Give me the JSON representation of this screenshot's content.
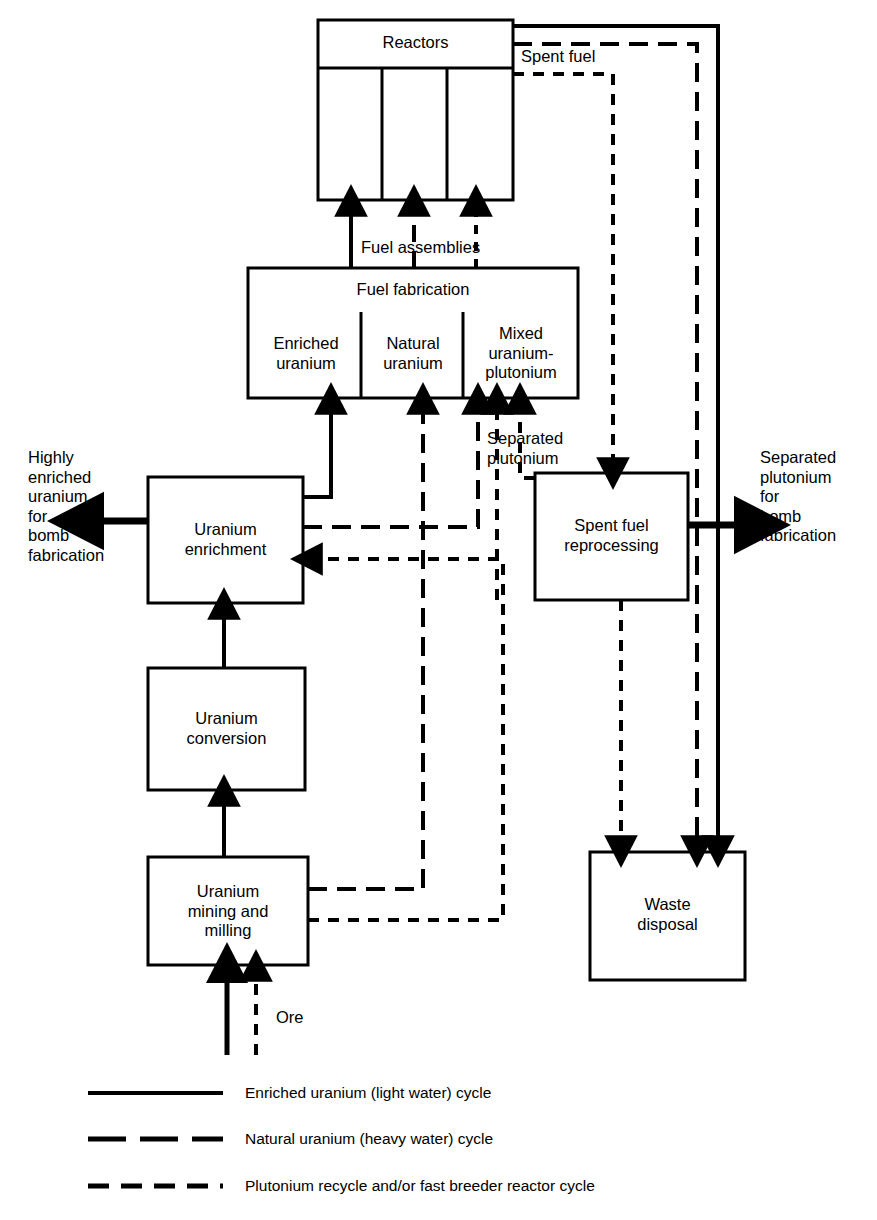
{
  "figure": {
    "type": "flow-diagram",
    "background": "#ffffff",
    "line_color": "#000000"
  },
  "boxes": {
    "reactors": {
      "label": "Reactors",
      "x": 318,
      "y": 20,
      "w": 195,
      "h": 180,
      "header_h": 48,
      "columns": 3
    },
    "fuel_fabrication": {
      "label": "Fuel fabrication",
      "x": 248,
      "y": 268,
      "w": 330,
      "h": 130,
      "header_h": 40,
      "cells": [
        "Enriched\nuranium",
        "Natural\nuranium",
        "Mixed\nuranium-\nplutonium"
      ]
    },
    "uranium_enrichment": {
      "label": "Uranium\nenrichment",
      "x": 148,
      "y": 477,
      "w": 155,
      "h": 126
    },
    "spent_fuel_reprocessing": {
      "label": "Spent fuel\nreprocessing",
      "x": 535,
      "y": 473,
      "w": 153,
      "h": 127
    },
    "uranium_conversion": {
      "label": "Uranium\nconversion",
      "x": 148,
      "y": 668,
      "w": 157,
      "h": 122
    },
    "uranium_mining": {
      "label": "Uranium\nmining and\nmilling",
      "x": 148,
      "y": 857,
      "w": 160,
      "h": 108
    },
    "waste_disposal": {
      "label": "Waste\ndisposal",
      "x": 590,
      "y": 852,
      "w": 155,
      "h": 128
    }
  },
  "flow_labels": {
    "spent_fuel": {
      "text": "Spent fuel",
      "x": 521,
      "y": 47
    },
    "fuel_assemblies": {
      "text": "Fuel assemblies",
      "x": 361,
      "y": 238
    },
    "separated_plutonium": {
      "text": "Separated\nplutonium",
      "x": 487,
      "y": 429
    },
    "highly_enriched_uranium_bomb": {
      "text": "Highly\nenriched\nuranium\nfor\nbomb\nfabrication",
      "x": 28,
      "y": 448
    },
    "separated_plutonium_bomb": {
      "text": "Separated\nplutonium\nfor\nbomb\nfabrication",
      "x": 760,
      "y": 448
    },
    "ore": {
      "text": "Ore",
      "x": 276,
      "y": 1018
    }
  },
  "legend": {
    "items": [
      {
        "style": "solid",
        "label": "Enriched uranium (light water) cycle"
      },
      {
        "style": "long-dash",
        "label": "Natural uranium (heavy water) cycle"
      },
      {
        "style": "short-dash",
        "label": "Plutonium recycle and/or fast breeder reactor cycle"
      }
    ],
    "sample_x": 88,
    "sample_w": 135,
    "text_x": 245,
    "rows_y": [
      1093,
      1139,
      1186
    ]
  },
  "flows": [
    {
      "from": "fuel_fabrication",
      "to": "reactors",
      "style": "solid",
      "label": "Fuel assemblies"
    },
    {
      "from": "fuel_fabrication",
      "to": "reactors",
      "style": "long-dash",
      "label": "Fuel assemblies"
    },
    {
      "from": "fuel_fabrication",
      "to": "reactors",
      "style": "short-dash",
      "label": "Fuel assemblies"
    },
    {
      "from": "reactors",
      "to": "waste_disposal",
      "style": "solid",
      "label": "Spent fuel"
    },
    {
      "from": "reactors",
      "to": "waste_disposal",
      "style": "long-dash",
      "label": "Spent fuel"
    },
    {
      "from": "reactors",
      "to": "spent_fuel_reprocessing",
      "style": "short-dash",
      "label": "Spent fuel"
    },
    {
      "from": "uranium_enrichment",
      "to": "fuel_fabrication",
      "style": "solid",
      "label": "Enriched uranium"
    },
    {
      "from": "uranium_enrichment",
      "to": "fuel_fabrication",
      "style": "long-dash",
      "label": ""
    },
    {
      "from": "uranium_mining",
      "to": "fuel_fabrication",
      "style": "long-dash",
      "label": ""
    },
    {
      "from": "uranium_mining",
      "to": "uranium_enrichment",
      "style": "short-dash",
      "label": ""
    },
    {
      "from": "uranium_mining",
      "to": "uranium_conversion",
      "style": "solid",
      "label": ""
    },
    {
      "from": "uranium_conversion",
      "to": "uranium_enrichment",
      "style": "solid",
      "label": ""
    },
    {
      "from": "spent_fuel_reprocessing",
      "to": "fuel_fabrication",
      "style": "short-dash",
      "label": "Separated plutonium"
    },
    {
      "from": "spent_fuel_reprocessing",
      "to": "waste_disposal",
      "style": "short-dash",
      "label": ""
    },
    {
      "from": "spent_fuel_reprocessing",
      "to": "external",
      "style": "solid",
      "label": "Separated plutonium for bomb fabrication"
    },
    {
      "from": "uranium_enrichment",
      "to": "external",
      "style": "solid",
      "label": "Highly enriched uranium for bomb fabrication"
    },
    {
      "from": "external",
      "to": "uranium_mining",
      "style": "solid",
      "label": "Ore"
    },
    {
      "from": "external",
      "to": "uranium_mining",
      "style": "short-dash",
      "label": "Ore"
    }
  ]
}
